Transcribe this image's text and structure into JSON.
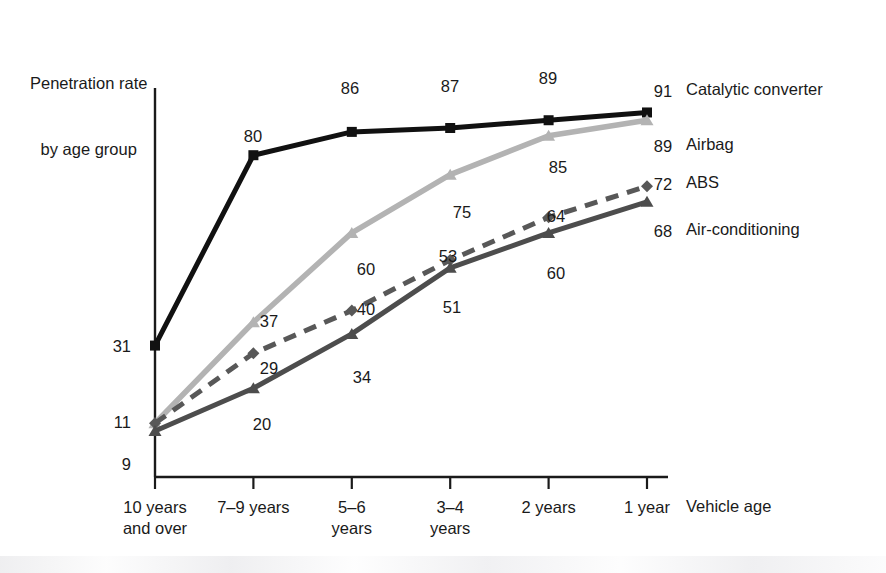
{
  "chart_data": {
    "type": "line",
    "title": "Penetration rate by age group",
    "title_line1": "Penetration rate",
    "title_line2": "by age group",
    "xlabel": "Vehicle age",
    "ylabel": "Penetration rate by age group",
    "categories": [
      "10 years and over",
      "7–9 years",
      "5–6 years",
      "3–4 years",
      "2 years",
      "1 year"
    ],
    "tick_label_lines": [
      [
        "10 years",
        "and over"
      ],
      [
        "7–9 years",
        ""
      ],
      [
        "5–6",
        "years"
      ],
      [
        "3–4",
        "years"
      ],
      [
        "2 years",
        ""
      ],
      [
        "1 year",
        ""
      ]
    ],
    "ylim": [
      0,
      100
    ],
    "grid": false,
    "legend_position": "right",
    "series": [
      {
        "name": "Catalytic converter",
        "color": "#111111",
        "marker": "square",
        "dash": "solid",
        "values": [
          31,
          80,
          86,
          87,
          89,
          91
        ],
        "end_value": 91
      },
      {
        "name": "Airbag",
        "color": "#b3b3b3",
        "marker": "triangle",
        "dash": "solid",
        "values": [
          11,
          37,
          60,
          75,
          85,
          89
        ],
        "end_value": 89
      },
      {
        "name": "ABS",
        "color": "#585858",
        "marker": "diamond",
        "dash": "dashed",
        "values": [
          11,
          29,
          40,
          53,
          64,
          72
        ],
        "end_value": 72
      },
      {
        "name": "Air-conditioning",
        "color": "#4d4d4d",
        "marker": "triangle",
        "dash": "solid",
        "values": [
          9,
          20,
          34,
          51,
          60,
          68
        ],
        "end_value": 68
      }
    ],
    "point_labels": [
      {
        "text": "31",
        "x": 131,
        "y": 352,
        "anchor": "end"
      },
      {
        "text": "11",
        "x": 131,
        "y": 428,
        "anchor": "end"
      },
      {
        "text": "9",
        "x": 131,
        "y": 470,
        "anchor": "end"
      },
      {
        "text": "80",
        "x": 253,
        "y": 142,
        "anchor": "middle"
      },
      {
        "text": "86",
        "x": 350,
        "y": 94,
        "anchor": "middle"
      },
      {
        "text": "87",
        "x": 450,
        "y": 92,
        "anchor": "middle"
      },
      {
        "text": "89",
        "x": 548,
        "y": 84,
        "anchor": "middle"
      },
      {
        "text": "37",
        "x": 269,
        "y": 327,
        "anchor": "middle"
      },
      {
        "text": "60",
        "x": 366,
        "y": 275,
        "anchor": "middle"
      },
      {
        "text": "75",
        "x": 462,
        "y": 218,
        "anchor": "middle"
      },
      {
        "text": "85",
        "x": 558,
        "y": 173,
        "anchor": "middle"
      },
      {
        "text": "29",
        "x": 269,
        "y": 374,
        "anchor": "middle"
      },
      {
        "text": "40",
        "x": 366,
        "y": 315,
        "anchor": "middle"
      },
      {
        "text": "53",
        "x": 448,
        "y": 262,
        "anchor": "middle"
      },
      {
        "text": "64",
        "x": 556,
        "y": 222,
        "anchor": "middle"
      },
      {
        "text": "20",
        "x": 262,
        "y": 430,
        "anchor": "middle"
      },
      {
        "text": "34",
        "x": 362,
        "y": 383,
        "anchor": "middle"
      },
      {
        "text": "51",
        "x": 452,
        "y": 313,
        "anchor": "middle"
      },
      {
        "text": "60",
        "x": 556,
        "y": 279,
        "anchor": "middle"
      }
    ],
    "end_labels": [
      {
        "text": "91",
        "x": 663,
        "y": 97
      },
      {
        "text": "89",
        "x": 663,
        "y": 152
      },
      {
        "text": "72",
        "x": 663,
        "y": 190
      },
      {
        "text": "68",
        "x": 663,
        "y": 237
      }
    ]
  },
  "legend": {
    "items": [
      {
        "label": "Catalytic converter",
        "top": 80
      },
      {
        "label": "Airbag",
        "top": 135
      },
      {
        "label": "ABS",
        "top": 173
      },
      {
        "label": "Air-conditioning",
        "top": 220
      }
    ]
  },
  "axes": {
    "x_axis_caption": "Vehicle age"
  }
}
